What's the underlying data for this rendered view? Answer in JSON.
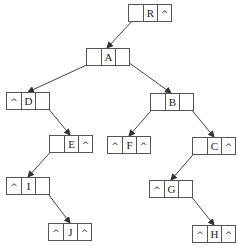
{
  "diagram": {
    "null_symbol": "^",
    "nodes": [
      {
        "id": "R",
        "label": "R",
        "left": "",
        "right": "^",
        "x": 128,
        "y": 4
      },
      {
        "id": "A",
        "label": "A",
        "left": "",
        "right": "",
        "x": 86,
        "y": 48
      },
      {
        "id": "D",
        "label": "D",
        "left": "^",
        "right": "",
        "x": 6,
        "y": 92
      },
      {
        "id": "B",
        "label": "B",
        "left": "",
        "right": "",
        "x": 150,
        "y": 93
      },
      {
        "id": "E",
        "label": "E",
        "left": "",
        "right": "^",
        "x": 49,
        "y": 135
      },
      {
        "id": "F",
        "label": "F",
        "left": "^",
        "right": "^",
        "x": 107,
        "y": 136
      },
      {
        "id": "C",
        "label": "C",
        "left": "",
        "right": "^",
        "x": 192,
        "y": 137
      },
      {
        "id": "I",
        "label": "I",
        "left": "^",
        "right": "",
        "x": 6,
        "y": 177
      },
      {
        "id": "G",
        "label": "G",
        "left": "^",
        "right": "",
        "x": 149,
        "y": 180
      },
      {
        "id": "J",
        "label": "J",
        "left": "^",
        "right": "^",
        "x": 48,
        "y": 223
      },
      {
        "id": "H",
        "label": "H",
        "left": "^",
        "right": "^",
        "x": 192,
        "y": 225
      }
    ],
    "edges": [
      {
        "from": "R",
        "side": "left",
        "to": "A",
        "x1": 135,
        "y1": 18,
        "x2": 107,
        "y2": 48
      },
      {
        "from": "A",
        "side": "left",
        "to": "D",
        "x1": 93,
        "y1": 62,
        "x2": 28,
        "y2": 92
      },
      {
        "from": "A",
        "side": "right",
        "to": "B",
        "x1": 121,
        "y1": 57,
        "x2": 171,
        "y2": 93
      },
      {
        "from": "D",
        "side": "right",
        "to": "E",
        "x1": 43,
        "y1": 102,
        "x2": 70,
        "y2": 135
      },
      {
        "from": "B",
        "side": "left",
        "to": "F",
        "x1": 156,
        "y1": 105,
        "x2": 129,
        "y2": 136
      },
      {
        "from": "B",
        "side": "right",
        "to": "C",
        "x1": 186,
        "y1": 103,
        "x2": 214,
        "y2": 137
      },
      {
        "from": "E",
        "side": "left",
        "to": "I",
        "x1": 55,
        "y1": 147,
        "x2": 28,
        "y2": 177
      },
      {
        "from": "C",
        "side": "left",
        "to": "G",
        "x1": 198,
        "y1": 149,
        "x2": 171,
        "y2": 180
      },
      {
        "from": "I",
        "side": "right",
        "to": "J",
        "x1": 43,
        "y1": 187,
        "x2": 70,
        "y2": 223
      },
      {
        "from": "G",
        "side": "right",
        "to": "H",
        "x1": 186,
        "y1": 190,
        "x2": 214,
        "y2": 225
      }
    ],
    "colors": {
      "line": "#444444",
      "border": "#555555",
      "text": "#222222",
      "background": "#ffffff"
    }
  }
}
